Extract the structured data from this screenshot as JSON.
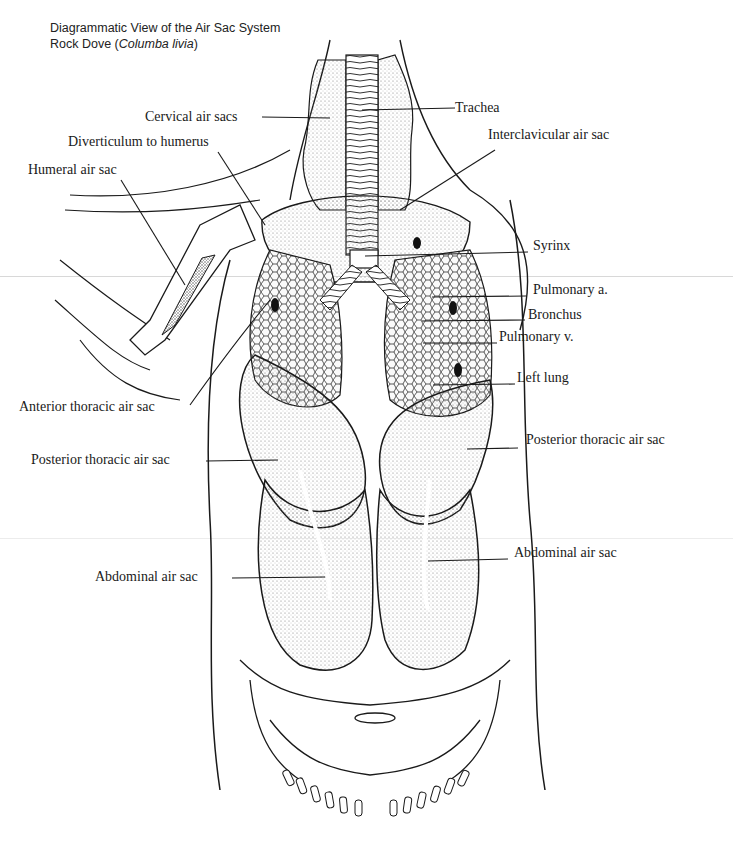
{
  "title": {
    "line1": "Diagrammatic View of the Air Sac System",
    "line2_prefix": "Rock Dove (",
    "line2_species": "Columba livia",
    "line2_suffix": ")"
  },
  "labels": {
    "cervical_air_sacs": "Cervical air sacs",
    "trachea": "Trachea",
    "diverticulum_to_humerus": "Diverticulum to humerus",
    "interclavicular_air_sac": "Interclavicular air sac",
    "humeral_air_sac": "Humeral air sac",
    "syrinx": "Syrinx",
    "pulmonary_a": "Pulmonary a.",
    "bronchus": "Bronchus",
    "pulmonary_v": "Pulmonary v.",
    "left_lung": "Left lung",
    "anterior_thoracic_air_sac": "Anterior thoracic air sac",
    "posterior_thoracic_air_sac_left": "Posterior thoracic air sac",
    "posterior_thoracic_air_sac_right": "Posterior thoracic air sac",
    "abdominal_air_sac_left": "Abdominal air sac",
    "abdominal_air_sac_right": "Abdominal air sac"
  },
  "colors": {
    "ink": "#1a1a1a",
    "stipple": "#9a9a9a",
    "background": "#ffffff"
  }
}
